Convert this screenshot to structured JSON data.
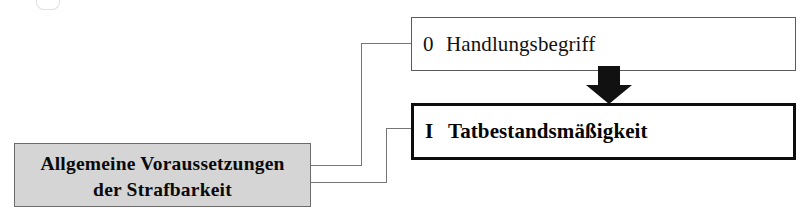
{
  "diagram": {
    "title": "Allgemeine Voraussetzungen der Strafbarkeit",
    "language": "de",
    "type": "flowchart",
    "background_color": "#ffffff"
  },
  "nodes": [
    {
      "id": "handlungsbegriff",
      "numeral": "0",
      "label": "Handlungsbegriff",
      "style": "thin-border",
      "fill": "#ffffff",
      "border_color": "#5a5a5a",
      "bold": false
    },
    {
      "id": "tatbestandsmaessigkeit",
      "numeral": "I",
      "label": "Tatbestandsmäßigkeit",
      "style": "thick-border",
      "fill": "#ffffff",
      "border_color": "#0d0d0d",
      "bold": true
    },
    {
      "id": "allgemeine-voraussetzungen",
      "label_line1": "Allgemeine Voraussetzungen",
      "label_line2": "der Strafbarkeit",
      "style": "gray-fill",
      "fill": "#d5d5d5",
      "border_color": "#6b6b6b",
      "bold": true
    }
  ],
  "connectors": [
    {
      "id": "root-to-handlungsbegriff",
      "from": "allgemeine-voraussetzungen",
      "to": "handlungsbegriff",
      "color": "#767676",
      "routing": "orthogonal"
    },
    {
      "id": "root-to-tatbestandsmaessigkeit",
      "from": "allgemeine-voraussetzungen",
      "to": "tatbestandsmaessigkeit",
      "color": "#767676",
      "routing": "orthogonal"
    }
  ],
  "arrows": [
    {
      "id": "arrow-handlungsbegriff-to-tatbestandsmaessigkeit",
      "from": "handlungsbegriff",
      "to": "tatbestandsmaessigkeit",
      "direction": "down",
      "color": "#111111",
      "style": "solid-block"
    }
  ]
}
